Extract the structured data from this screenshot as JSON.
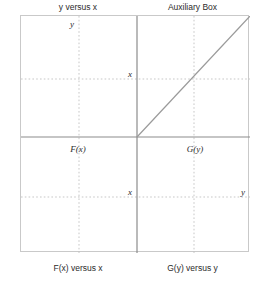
{
  "figure": {
    "type": "diagram",
    "captions": {
      "top_left": "y versus x",
      "top_right": "Auxiliary Box",
      "bottom_left": "F(x) versus x",
      "bottom_right": "G(y) versus y"
    },
    "interior_labels": [
      {
        "text": "y",
        "x": 78,
        "y": 24,
        "name": "label-y-upper-left"
      },
      {
        "text": "x",
        "x": 129,
        "y": 74,
        "name": "label-x-upper"
      },
      {
        "text": "F(x)",
        "x": 78,
        "y": 150,
        "name": "label-f-of-x"
      },
      {
        "text": "G(y)",
        "x": 193,
        "y": 150,
        "name": "label-g-of-y"
      },
      {
        "text": "x",
        "x": 129,
        "y": 192,
        "name": "label-x-lower"
      },
      {
        "text": "y",
        "x": 241,
        "y": 192,
        "name": "label-y-lower-right"
      }
    ],
    "geometry": {
      "box": {
        "left": 20,
        "top": 15,
        "width": 229,
        "height": 237
      },
      "center": {
        "x": 116,
        "y": 121
      },
      "axis_color": "#8c8c8c",
      "grid_color": "#b9b9b9",
      "border_color": "#c9c9c9",
      "diagonal_color": "#9a9a9a",
      "grid_vertical": [
        58,
        173
      ],
      "grid_horizontal": [
        63,
        181
      ],
      "diagonal": {
        "x1": 116,
        "y1": 121,
        "x2": 229,
        "y2": 0
      }
    }
  }
}
